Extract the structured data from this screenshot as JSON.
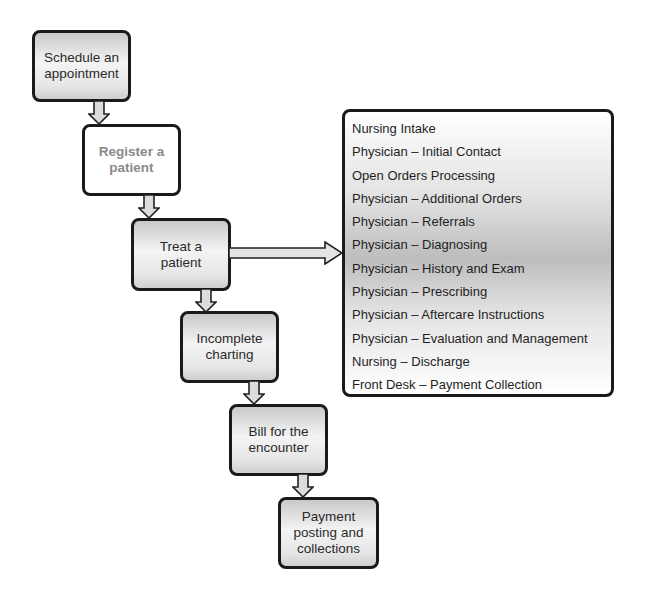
{
  "diagram": {
    "type": "flowchart",
    "steps": [
      {
        "id": "schedule",
        "label": "Schedule an appointment"
      },
      {
        "id": "register",
        "label": "Register a patient"
      },
      {
        "id": "treat",
        "label": "Treat a patient"
      },
      {
        "id": "charting",
        "label": "Incomplete charting"
      },
      {
        "id": "bill",
        "label": "Bill for the encounter"
      },
      {
        "id": "payment",
        "label": "Payment posting and collections"
      }
    ],
    "treat_details": {
      "items": [
        "Nursing Intake",
        "Physician – Initial Contact",
        "Open Orders Processing",
        "Physician – Additional Orders",
        "Physician – Referrals",
        "Physician – Diagnosing",
        "Physician – History and Exam",
        "Physician – Prescribing",
        "Physician – Aftercare Instructions",
        "Physician – Evaluation and Management",
        "Nursing – Discharge",
        "Front Desk – Payment Collection"
      ]
    },
    "connections": [
      {
        "from": "schedule",
        "to": "register",
        "direction": "down"
      },
      {
        "from": "register",
        "to": "treat",
        "direction": "down"
      },
      {
        "from": "treat",
        "to": "treat_details",
        "direction": "right"
      },
      {
        "from": "treat",
        "to": "charting",
        "direction": "down"
      },
      {
        "from": "charting",
        "to": "bill",
        "direction": "down"
      },
      {
        "from": "bill",
        "to": "payment",
        "direction": "down"
      }
    ]
  }
}
